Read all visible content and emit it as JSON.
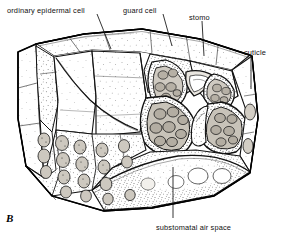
{
  "figure": {
    "letter": "B",
    "caption_labels": {
      "epidermal": "ordinary epidermal cell",
      "guard": "guard cell",
      "stoma": "stomo",
      "cuticle": "cuticle",
      "substomatal": "substomatal air space"
    },
    "style": {
      "ink": "#111111",
      "paper": "#ffffff",
      "stipple": "#2a2a2a",
      "wall_fill": "#d8d4cc",
      "lumen_fill": "#bfbab0"
    },
    "leaders": [
      {
        "name": "epidermal",
        "x1": 97,
        "y1": 14,
        "x2": 111,
        "y2": 49
      },
      {
        "name": "guard",
        "x1": 163,
        "y1": 14,
        "x2": 172,
        "y2": 46
      },
      {
        "name": "stoma",
        "x1": 202,
        "y1": 21,
        "x2": 204,
        "y2": 56
      },
      {
        "name": "cuticle",
        "x1": 251,
        "y1": 56,
        "x2": 251,
        "y2": 89
      },
      {
        "name": "substomatal",
        "x1": 173,
        "y1": 218,
        "x2": 173,
        "y2": 167
      }
    ]
  }
}
